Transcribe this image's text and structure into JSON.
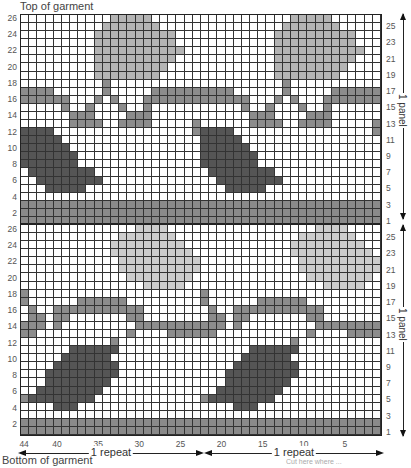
{
  "titles": {
    "top": "Top of garment",
    "bottom": "Bottom of garment"
  },
  "caption": "Cut here where ... ",
  "colors": {
    "white": "#ffffff",
    "vine": "#8c8c8c",
    "dark_leaf": "#555555",
    "light_leaf": "#b4b4b4",
    "pale_leaf": "#cdcdcd",
    "band": "#8a8a8a",
    "grid_line": "#333333"
  },
  "legend_keys": {
    ".": "background (white)",
    "v": "vine (mid gray)",
    "d": "dark leaf",
    "l": "light leaf",
    "L": "pale leaf",
    "b": "border band"
  },
  "grid": {
    "columns": 44,
    "rows_per_panel": 26,
    "panels": 2,
    "repeat_width": 22
  },
  "row_labels_left": [
    "26",
    "24",
    "22",
    "20",
    "18",
    "16",
    "14",
    "12",
    "10",
    "8",
    "6",
    "4",
    "2"
  ],
  "row_labels_right": [
    "25",
    "23",
    "21",
    "19",
    "17",
    "15",
    "13",
    "11",
    "9",
    "7",
    "5",
    "3",
    "1"
  ],
  "column_labels": [
    "44",
    "40",
    "35",
    "30",
    "25",
    "20",
    "15",
    "10",
    "5"
  ],
  "column_label_values": [
    44,
    40,
    35,
    30,
    25,
    20,
    15,
    10,
    5
  ],
  "panel_label": "1 panel",
  "repeat_label": "1 repeat",
  "chart_data": {
    "type": "table",
    "xlabel": "Stitches (44 → 1)",
    "ylabel": "Rows (1 → 26 per panel)",
    "panels": [
      {
        "name": "upper panel",
        "rows_top_to_bottom": [
          "...........lllll......",
          "..........lllllll.....",
          ".........llllllllll...",
          ".........llllllllll...",
          ".........lllllllllll..",
          ".........llllllllll...",
          ".........lllllllll....",
          ".........llllllll.....",
          "..........v...........",
          "vvvv......v.....vvvvvv",
          "vvvvvv...v.v...vvvvvvv",
          ".....v..v...v..v......",
          "......vvv....vvv......",
          "......vvvv..vvvv.....v",
          "dddd.................v",
          "ddddd.................",
          "dddddd................",
          "ddddddd...............",
          "ddddddd...............",
          ".dddddddd.............",
          "..dddddddd............",
          "...ddddd..............",
          "......................",
          "bbbbbbbbbbbbbbbbbbbbbb",
          "bbbbbbbbbbbbbbbbbbbbbb",
          "bbbbbbbbbbbbbbbbbbbbbb"
        ]
      },
      {
        "name": "lower panel",
        "rows_top_to_bottom": [
          "..............LLLL....",
          "............LLLLLLL...",
          "...........LLLLLLLLL..",
          "...........LLLLLLLLLL.",
          "............LLLLLLLLLL",
          "............LLLLLLLLLL",
          ".............LLLLLLLL.",
          "...............LLLLL..",
          "v.....................",
          "v......vvvvvv.........",
          ".v..vvvvvvvvvvv.......",
          ".vv.vv.......vv.......",
          "vvv.v.........vvvvvvvv",
          "vv...........v....vvvv",
          "...........v..........",
          "......dddddd..........",
          ".....dddddd...........",
          "....dddddddd..........",
          "...ddddddddd..........",
          "...dddddddd...........",
          "..dddddddd............",
          "vdddddddd.............",
          "....ddd...............",
          "......................",
          "bbbbbbbbbbbbbbbbbbbbbb",
          "bbbbbbbbbbbbbbbbbbbbbb"
        ]
      }
    ]
  }
}
